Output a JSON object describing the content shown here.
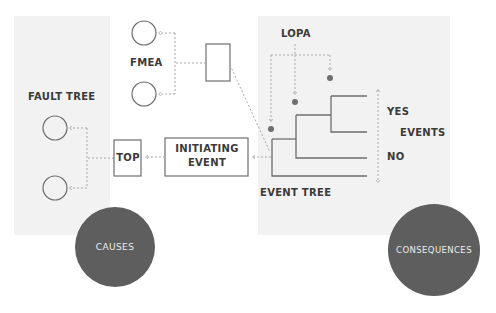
{
  "colors": {
    "background": "#ffffff",
    "panel": "#f2f2f2",
    "line": "#6e6e6e",
    "dotted": "#a8a8a8",
    "bubble": "#5e5e5e",
    "bubble_text": "#ececec",
    "label": "#3a3a3a"
  },
  "labels": {
    "fmea": "FMEA",
    "fault_tree": "FAULT TREE",
    "top": "TOP",
    "initiating_event_line1": "INITIATING",
    "initiating_event_line2": "EVENT",
    "lopa": "LOPA",
    "yes": "YES",
    "events": "EVENTS",
    "no": "NO",
    "event_tree": "EVENT TREE"
  },
  "bubbles": {
    "causes": "CAUSES",
    "consequences": "CONSEQUENCES"
  },
  "nodes": {
    "fmea_circles": 2,
    "fault_tree_circles": 2,
    "lopa_dots": 3,
    "event_tree_outcomes": 4
  }
}
